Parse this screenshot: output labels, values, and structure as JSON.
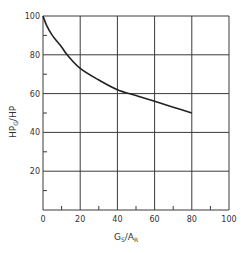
{
  "chart_data": {
    "type": "line",
    "title": "",
    "xlabel": "Gs/AR",
    "xlabel_main": "G",
    "xlabel_sub1": "S",
    "xlabel_mid": "/A",
    "xlabel_sub2": "R",
    "ylabel": "HPG/HP",
    "ylabel_main": "HP",
    "ylabel_sub": "G",
    "ylabel_tail": "/HP",
    "xlim": [
      0,
      100
    ],
    "ylim": [
      0,
      100
    ],
    "grid": true,
    "legend": null,
    "x_ticks": [
      "0",
      "20",
      "40",
      "60",
      "80",
      "100"
    ],
    "y_ticks": [
      "20",
      "40",
      "60",
      "80",
      "100"
    ],
    "series": [
      {
        "name": "HPG/HP vs Gs/AR",
        "x": [
          0,
          2,
          5,
          10,
          13,
          20,
          30,
          40,
          50,
          60,
          70,
          80
        ],
        "values": [
          100,
          95,
          90,
          84,
          80,
          73,
          67,
          62,
          59,
          56,
          53,
          50
        ]
      }
    ]
  }
}
